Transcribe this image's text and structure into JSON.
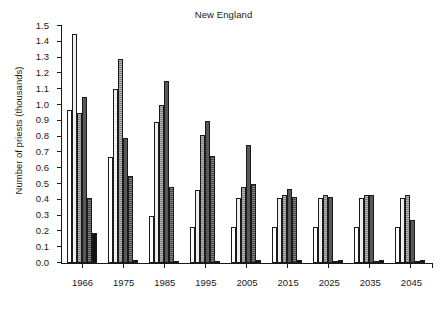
{
  "chart_data": {
    "type": "bar",
    "title": "New England",
    "xlabel": "",
    "ylabel": "Number of priests (thousands)",
    "ylim": [
      0.0,
      1.5
    ],
    "ytick_labels": [
      "0.0",
      "0.1",
      "0.2",
      "0.3",
      "0.4",
      "0.5",
      "0.6",
      "0.7",
      "0.8",
      "0.9",
      "1.0",
      "1.1",
      "1.2",
      "1.3",
      "1.4",
      "1.5"
    ],
    "ytick_values": [
      0.0,
      0.1,
      0.2,
      0.3,
      0.4,
      0.5,
      0.6,
      0.7,
      0.8,
      0.9,
      1.0,
      1.1,
      1.2,
      1.3,
      1.4,
      1.5
    ],
    "grid": false,
    "legend_position": "none",
    "categories": [
      "1966",
      "1975",
      "1985",
      "1995",
      "2005",
      "2015",
      "2025",
      "2035",
      "2045"
    ],
    "series": [
      {
        "name": "series-1",
        "fill": "#ffffff",
        "values": [
          0.97,
          0.67,
          0.3,
          0.23,
          0.23,
          0.23,
          0.23,
          0.23,
          0.23
        ]
      },
      {
        "name": "series-2",
        "fill": "#efefef",
        "values": [
          1.45,
          1.1,
          0.89,
          0.46,
          0.41,
          0.41,
          0.41,
          0.41,
          0.41
        ]
      },
      {
        "name": "series-3",
        "fill": "#b8b8b8",
        "values": [
          0.95,
          1.29,
          1.0,
          0.81,
          0.48,
          0.43,
          0.43,
          0.43,
          0.43
        ]
      },
      {
        "name": "series-4",
        "fill": "#585858",
        "values": [
          1.05,
          0.79,
          1.15,
          0.9,
          0.75,
          0.47,
          0.42,
          0.43,
          0.27
        ]
      },
      {
        "name": "series-5",
        "fill": "#7a7a7a",
        "values": [
          0.41,
          0.55,
          0.48,
          0.68,
          0.5,
          0.42,
          0.0,
          0.0,
          0.0
        ]
      },
      {
        "name": "series-6",
        "fill": "#121212",
        "values": [
          0.19,
          0.02,
          0.015,
          0.015,
          0.02,
          0.02,
          0.02,
          0.02,
          0.02
        ]
      }
    ]
  }
}
